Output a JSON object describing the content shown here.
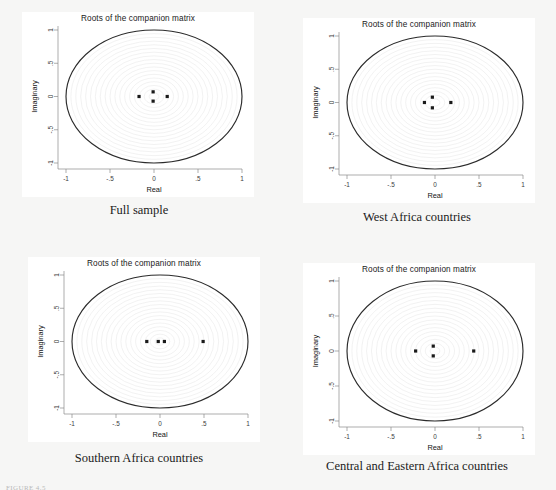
{
  "figure": {
    "note": "FIGURE 4.5",
    "background_color": "#f6f6f5",
    "panel_background": "#ffffff",
    "unit_circle_color": "#2b2b2b",
    "grid_circle_color": "#e2e2e2",
    "point_color": "#1a1a1a",
    "axis_color": "#8a8a8a"
  },
  "axis": {
    "xlabel": "Real",
    "ylabel": "Imaginary",
    "xticks": [
      "-1",
      "-.5",
      "0",
      ".5",
      "1"
    ],
    "yticks": [
      "-1",
      "-.5",
      "0",
      ".5",
      "1"
    ],
    "xlim": [
      -1,
      1
    ],
    "ylim": [
      -1,
      1
    ]
  },
  "panels": [
    {
      "id": "full-sample",
      "title": "Roots of the companion matrix",
      "caption": "Full sample"
    },
    {
      "id": "west-africa",
      "title": "Roots of the companion matrix",
      "caption": "West Africa countries"
    },
    {
      "id": "southern-africa",
      "title": "Roots of the companion matrix",
      "caption": "Southern Africa countries"
    },
    {
      "id": "central-eastern-africa",
      "title": "Roots of the companion matrix",
      "caption": "Central and Eastern Africa countries"
    }
  ],
  "chart_data": [
    {
      "type": "scatter",
      "title": "Roots of the companion matrix",
      "subtitle": "Full sample",
      "xlabel": "Real",
      "ylabel": "Imaginary",
      "xlim": [
        -1,
        1
      ],
      "ylim": [
        -1,
        1
      ],
      "xticks": [
        -1,
        -0.5,
        0,
        0.5,
        1
      ],
      "yticks": [
        -1,
        -0.5,
        0,
        0.5,
        1
      ],
      "grid": true,
      "legend": "none",
      "annotations": [
        "unit circle drawn at radius 1",
        "faint concentric grid circles"
      ],
      "points": [
        {
          "real": -0.17,
          "imaginary": 0.0
        },
        {
          "real": -0.01,
          "imaginary": 0.07
        },
        {
          "real": -0.01,
          "imaginary": -0.07
        },
        {
          "real": 0.15,
          "imaginary": 0.0
        }
      ]
    },
    {
      "type": "scatter",
      "title": "Roots of the companion matrix",
      "subtitle": "West Africa countries",
      "xlabel": "Real",
      "ylabel": "Imaginary",
      "xlim": [
        -1,
        1
      ],
      "ylim": [
        -1,
        1
      ],
      "xticks": [
        -1,
        -0.5,
        0,
        0.5,
        1
      ],
      "yticks": [
        -1,
        -0.5,
        0,
        0.5,
        1
      ],
      "grid": true,
      "legend": "none",
      "annotations": [
        "unit circle drawn at radius 1",
        "faint concentric grid circles"
      ],
      "points": [
        {
          "real": -0.12,
          "imaginary": 0.0
        },
        {
          "real": -0.03,
          "imaginary": 0.08
        },
        {
          "real": -0.03,
          "imaginary": -0.08
        },
        {
          "real": 0.18,
          "imaginary": 0.0
        }
      ]
    },
    {
      "type": "scatter",
      "title": "Roots of the companion matrix",
      "subtitle": "Southern Africa countries",
      "xlabel": "Real",
      "ylabel": "Imaginary",
      "xlim": [
        -1,
        1
      ],
      "ylim": [
        -1,
        1
      ],
      "xticks": [
        -1,
        -0.5,
        0,
        0.5,
        1
      ],
      "yticks": [
        -1,
        -0.5,
        0,
        0.5,
        1
      ],
      "grid": true,
      "legend": "none",
      "annotations": [
        "unit circle drawn at radius 1",
        "all roots real"
      ],
      "points": [
        {
          "real": -0.15,
          "imaginary": 0.0
        },
        {
          "real": -0.02,
          "imaginary": 0.0
        },
        {
          "real": 0.05,
          "imaginary": 0.0
        },
        {
          "real": 0.49,
          "imaginary": 0.0
        }
      ]
    },
    {
      "type": "scatter",
      "title": "Roots of the companion matrix",
      "subtitle": "Central and Eastern Africa countries",
      "xlabel": "Real",
      "ylabel": "Imaginary",
      "xlim": [
        -1,
        1
      ],
      "ylim": [
        -1,
        1
      ],
      "xticks": [
        -1,
        -0.5,
        0,
        0.5,
        1
      ],
      "yticks": [
        -1,
        -0.5,
        0,
        0.5,
        1
      ],
      "grid": true,
      "legend": "none",
      "annotations": [
        "unit circle drawn at radius 1",
        "faint concentric grid circles"
      ],
      "points": [
        {
          "real": -0.22,
          "imaginary": 0.0
        },
        {
          "real": -0.02,
          "imaginary": 0.07
        },
        {
          "real": -0.02,
          "imaginary": -0.07
        },
        {
          "real": 0.44,
          "imaginary": 0.0
        }
      ]
    }
  ]
}
